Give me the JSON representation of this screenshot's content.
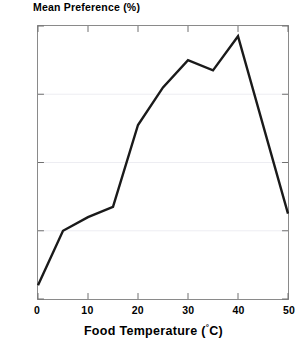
{
  "chart_data": {
    "type": "line",
    "title": "",
    "xlabel": "Food Temperature (°C)",
    "ylabel": "Mean Preference (%)",
    "x": [
      0,
      5,
      10,
      15,
      20,
      25,
      30,
      35,
      40,
      50
    ],
    "values": [
      4,
      20,
      24,
      27,
      51,
      62,
      70,
      67,
      77,
      25
    ],
    "series": [
      {
        "name": "Mean Preference",
        "values": [
          4,
          20,
          24,
          27,
          51,
          62,
          70,
          67,
          77,
          25
        ]
      }
    ],
    "xlim": [
      0,
      50
    ],
    "ylim": [
      0,
      80
    ],
    "xticks": [
      0,
      10,
      20,
      30,
      40,
      50
    ],
    "yticks": [
      0,
      20,
      40,
      60,
      80
    ],
    "grid": true,
    "legend": false,
    "line_color": "#1a1a1a"
  },
  "axes": {
    "y_title": "Mean Preference (%)",
    "x_title_main": "Food Temperature (",
    "x_title_degree": "°",
    "x_title_unit": "C)",
    "y_tick_labels": [
      "0",
      "20",
      "40",
      "60",
      "80"
    ],
    "x_tick_labels": [
      "0",
      "10",
      "20",
      "30",
      "40",
      "50"
    ]
  },
  "style": {
    "frame_color": "#8a8a8a",
    "grid_color": "#ededf2",
    "line_color": "#1a1a1a",
    "background": "#ffffff"
  }
}
